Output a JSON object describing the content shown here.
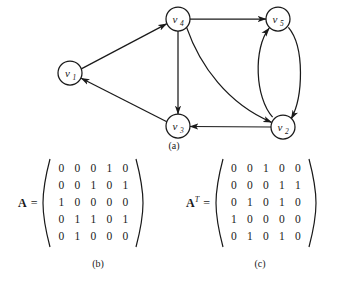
{
  "figure": {
    "panel_a_caption": "(a)",
    "panel_b_caption": "(b)",
    "panel_c_caption": "(c)",
    "line_color": "#1a1a1a",
    "background": "#ffffff"
  },
  "graph": {
    "nodes": [
      {
        "id": "v1",
        "base": "v",
        "sub": "1",
        "cx": 70,
        "cy": 73,
        "r": 12
      },
      {
        "id": "v2",
        "base": "v",
        "sub": "2",
        "cx": 283,
        "cy": 127,
        "r": 12
      },
      {
        "id": "v3",
        "base": "v",
        "sub": "3",
        "cx": 178,
        "cy": 126,
        "r": 12
      },
      {
        "id": "v4",
        "base": "v",
        "sub": "4",
        "cx": 178,
        "cy": 19,
        "r": 12
      },
      {
        "id": "v5",
        "base": "v",
        "sub": "5",
        "cx": 278,
        "cy": 19,
        "r": 12
      }
    ],
    "edges": [
      {
        "from": "v1",
        "to": "v4",
        "shape": "straight"
      },
      {
        "from": "v4",
        "to": "v5",
        "shape": "straight"
      },
      {
        "from": "v4",
        "to": "v3",
        "shape": "straight"
      },
      {
        "from": "v4",
        "to": "v2",
        "shape": "curved"
      },
      {
        "from": "v3",
        "to": "v1",
        "shape": "straight"
      },
      {
        "from": "v2",
        "to": "v3",
        "shape": "straight"
      },
      {
        "from": "v2",
        "to": "v5",
        "shape": "curved-left"
      },
      {
        "from": "v5",
        "to": "v2",
        "shape": "curved-right"
      }
    ]
  },
  "matrix_a": {
    "name": "A",
    "superscript": "",
    "equals": "=",
    "rows": [
      [
        "0",
        "0",
        "0",
        "1",
        "0"
      ],
      [
        "0",
        "0",
        "1",
        "0",
        "1"
      ],
      [
        "1",
        "0",
        "0",
        "0",
        "0"
      ],
      [
        "0",
        "1",
        "1",
        "0",
        "1"
      ],
      [
        "0",
        "1",
        "0",
        "0",
        "0"
      ]
    ]
  },
  "matrix_at": {
    "name": "A",
    "superscript": "T",
    "equals": "=",
    "rows": [
      [
        "0",
        "0",
        "1",
        "0",
        "0"
      ],
      [
        "0",
        "0",
        "0",
        "1",
        "1"
      ],
      [
        "0",
        "1",
        "0",
        "1",
        "0"
      ],
      [
        "1",
        "0",
        "0",
        "0",
        "0"
      ],
      [
        "0",
        "1",
        "0",
        "1",
        "0"
      ]
    ]
  }
}
